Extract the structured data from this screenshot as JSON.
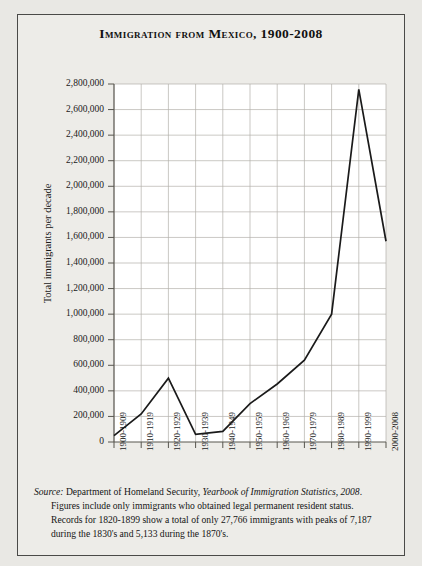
{
  "figure": {
    "title": "Immigration from Mexico, 1900-2008",
    "source_label": "Source:",
    "source_body_1": " Department of Homeland Security, ",
    "source_italic_1": "Yearbook of Immigration Statistics, 2008",
    "source_body_2": ". Figures include only immigrants who obtained legal permanent resident status. Records for 1820-1899 show a total of only 27,766 immigrants with peaks of 7,187 during the 1830's and 5,133 during the 1870's."
  },
  "chart_data": {
    "type": "line",
    "title": "Immigration from Mexico, 1900-2008",
    "xlabel": "",
    "ylabel": "Total immigrants per decade",
    "categories": [
      "1900-1909",
      "1910-1919",
      "1920-1929",
      "1930-1939",
      "1940-1949",
      "1950-1959",
      "1960-1969",
      "1970-1979",
      "1980-1989",
      "1990-1999",
      "2000-2008"
    ],
    "values": [
      49642,
      219004,
      498945,
      60589,
      83366,
      299811,
      453937,
      640294,
      1000000,
      2757418,
      1570000
    ],
    "ylim": [
      0,
      2800000
    ],
    "ytick_values": [
      0,
      200000,
      400000,
      600000,
      800000,
      1000000,
      1200000,
      1400000,
      1600000,
      1800000,
      2000000,
      2200000,
      2400000,
      2600000,
      2800000
    ],
    "ytick_labels": [
      "0",
      "200,000",
      "400,000",
      "600,000",
      "800,000",
      "1,000,000",
      "1,200,000",
      "1,400,000",
      "1,600,000",
      "1,800,000",
      "2,000,000",
      "2,200,000",
      "2,400,000",
      "2,600,000",
      "2,800,000"
    ],
    "grid": true,
    "legend": "none",
    "line_color": "#1a1a1a",
    "grid_color": "#b3b0aa",
    "axis_color": "#58564f",
    "plot_bg": "#ffffff"
  }
}
